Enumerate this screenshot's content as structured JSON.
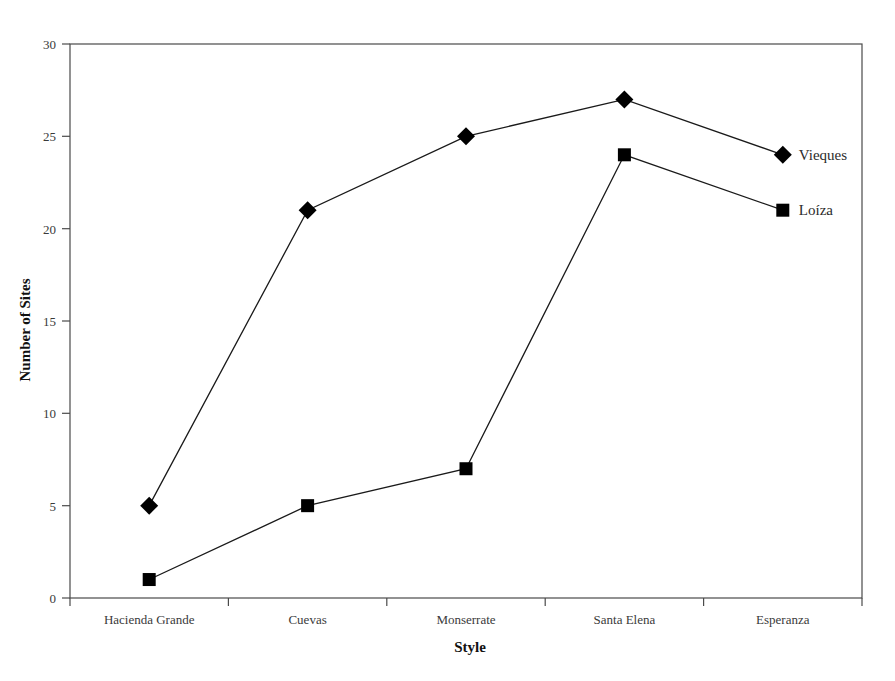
{
  "chart_data": {
    "type": "line",
    "title": "",
    "xlabel": "Style",
    "ylabel": "Number of Sites",
    "categories": [
      "Hacienda Grande",
      "Cuevas",
      "Monserrate",
      "Santa Elena",
      "Esperanza"
    ],
    "series": [
      {
        "name": "Vieques",
        "marker": "diamond",
        "color": "#000000",
        "values": [
          5,
          21,
          25,
          27,
          24
        ]
      },
      {
        "name": "Loíza",
        "marker": "square",
        "color": "#000000",
        "values": [
          1,
          5,
          7,
          24,
          21
        ]
      }
    ],
    "ylim": [
      0,
      30
    ],
    "ytick_labels": [
      "0",
      "5",
      "10",
      "15",
      "20",
      "25",
      "30"
    ],
    "ytick_values": [
      0,
      5,
      10,
      15,
      20,
      25,
      30
    ],
    "grid": false,
    "legend_position": "inline-right-endpoints",
    "frame": "box"
  },
  "axes": {
    "y_title": "Number of Sites",
    "x_title": "Style"
  },
  "ticks": {
    "y": [
      "0",
      "5",
      "10",
      "15",
      "20",
      "25",
      "30"
    ],
    "x": [
      "Hacienda Grande",
      "Cuevas",
      "Monserrate",
      "Santa Elena",
      "Esperanza"
    ]
  },
  "legend": {
    "entries": [
      {
        "label": "Vieques",
        "marker": "diamond"
      },
      {
        "label": "Loíza",
        "marker": "square"
      }
    ]
  }
}
